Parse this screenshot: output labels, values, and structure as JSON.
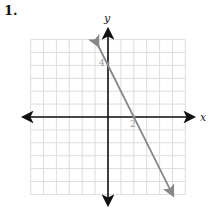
{
  "problem": {
    "number": "1."
  },
  "chart_data": {
    "type": "line",
    "title": "",
    "xlabel": "x",
    "ylabel": "y",
    "xlim": [
      -6,
      6
    ],
    "ylim": [
      -6,
      6
    ],
    "grid": true,
    "annotations": [
      {
        "text": "4",
        "x": 0,
        "y": 4,
        "position": "left of y-axis"
      },
      {
        "text": "2",
        "x": 2,
        "y": 0,
        "position": "below x-axis"
      }
    ],
    "series": [
      {
        "name": "line",
        "equation": "y = -2x + 4",
        "x": [
          -0.8,
          5
        ],
        "y": [
          5.6,
          -6
        ],
        "color": "#888888",
        "arrows": "both ends"
      }
    ]
  },
  "axes": {
    "x_label": "x",
    "y_label": "y",
    "y_intercept_label": "4",
    "x_intercept_label": "2"
  },
  "colors": {
    "grid": "#dddddd",
    "axis": "#111111",
    "line": "#888888"
  }
}
